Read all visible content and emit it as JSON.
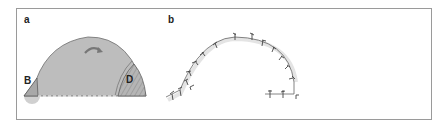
{
  "panels": [
    {
      "label": "a",
      "description": "Grey dome cross-section with small wedge B on the left and hatched wedge D on the right, curved arrow near top, dashed base line",
      "regions": [
        {
          "tag": "B",
          "shape": "small-triangle",
          "position": "left-base"
        },
        {
          "tag": "D",
          "shape": "hatched-wedge",
          "position": "right-base"
        }
      ],
      "icons": [
        "curved-arrow-icon"
      ]
    },
    {
      "label": "b",
      "description": "Arched line with small tick/barb marks along its length, ending in a short horizontal segment",
      "tick_count": 16
    }
  ],
  "colors": {
    "frame": "#9a9a9a",
    "dome_fill": "#bdbdbd",
    "dome_stroke": "#6e6e6e",
    "wedge_fill": "#a8a8a8",
    "halo": "#e6e6e6",
    "line": "#555555",
    "label": "#222222"
  }
}
